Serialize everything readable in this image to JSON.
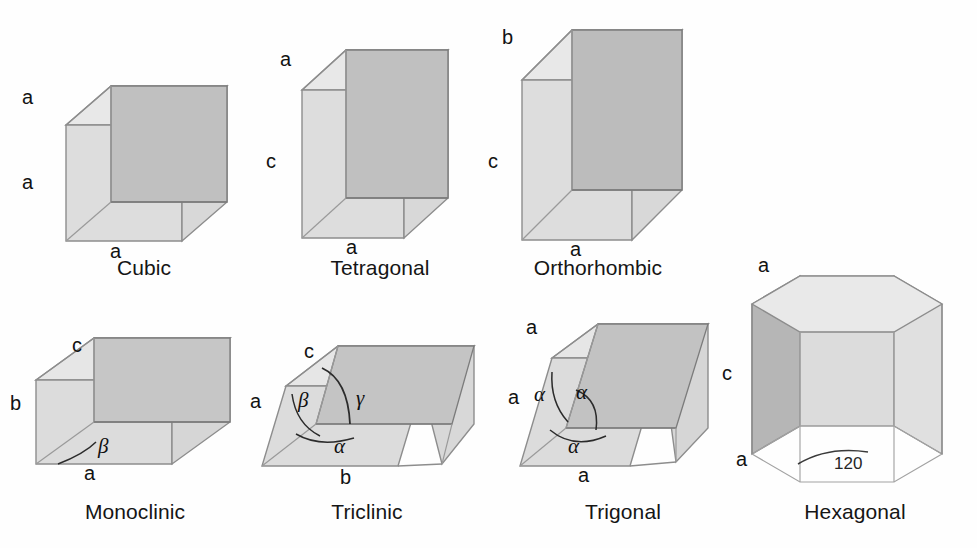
{
  "figure": {
    "background_color": "#fefefe",
    "palette": {
      "edge_stroke": "#8a8a8a",
      "edge_stroke_dark": "#6e6e6e",
      "face_light": "#e3e3e3",
      "face_mid": "#d2d2d2",
      "face_dark": "#bdbdbd",
      "face_darkest": "#ababab",
      "text": "#151515"
    }
  },
  "systems": [
    {
      "id": "cubic",
      "label": "Cubic",
      "axis_labels": {
        "top": "a",
        "left": "a",
        "bottom": "a"
      },
      "angle_labels": []
    },
    {
      "id": "tetragonal",
      "label": "Tetragonal",
      "axis_labels": {
        "top": "a",
        "left": "c",
        "bottom": "a"
      },
      "angle_labels": []
    },
    {
      "id": "orthorhombic",
      "label": "Orthorhombic",
      "axis_labels": {
        "top": "b",
        "left": "c",
        "bottom": "a"
      },
      "angle_labels": []
    },
    {
      "id": "monoclinic",
      "label": "Monoclinic",
      "axis_labels": {
        "top": "c",
        "left": "b",
        "bottom": "a"
      },
      "angle_labels": [
        "β"
      ]
    },
    {
      "id": "triclinic",
      "label": "Triclinic",
      "axis_labels": {
        "top": "c",
        "left": "a",
        "bottom": "b"
      },
      "angle_labels": [
        "β",
        "γ",
        "α"
      ]
    },
    {
      "id": "trigonal",
      "label": "Trigonal",
      "axis_labels": {
        "top": "a",
        "left": "a",
        "bottom": "a"
      },
      "angle_labels": [
        "α",
        "α",
        "α"
      ]
    },
    {
      "id": "hexagonal",
      "label": "Hexagonal",
      "axis_labels": {
        "top": "a",
        "left": "c",
        "bottom": "a"
      },
      "angle_labels": [
        "120"
      ]
    }
  ],
  "cubic": {
    "label": "Cubic",
    "a_top": "a",
    "a_left": "a",
    "a_bottom": "a"
  },
  "tetragonal": {
    "label": "Tetragonal",
    "a_top": "a",
    "c_left": "c",
    "a_bottom": "a"
  },
  "orthorhombic": {
    "label": "Orthorhombic",
    "b_top": "b",
    "c_left": "c",
    "a_bottom": "a"
  },
  "monoclinic": {
    "label": "Monoclinic",
    "c_top": "c",
    "b_left": "b",
    "a_bottom": "a",
    "beta": "β"
  },
  "triclinic": {
    "label": "Triclinic",
    "c_top": "c",
    "a_left": "a",
    "b_bottom": "b",
    "beta": "β",
    "gamma": "γ",
    "alpha": "α"
  },
  "trigonal": {
    "label": "Trigonal",
    "a_top": "a",
    "a_left": "a",
    "a_bottom": "a",
    "alpha_left": "α",
    "alpha_mid": "α",
    "alpha_bottom": "α"
  },
  "hexagonal": {
    "label": "Hexagonal",
    "a_top": "a",
    "c_left": "c",
    "a_bottom": "a",
    "angle_120": "120"
  }
}
